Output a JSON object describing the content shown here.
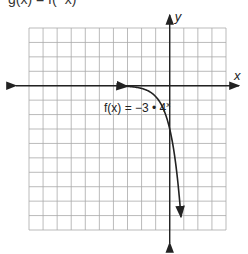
{
  "header_fragment": "g(x) = f(−x)",
  "chart_data": {
    "type": "line",
    "title": "",
    "xlabel": "x",
    "ylabel": "y",
    "xlim": [
      -10,
      4
    ],
    "ylim": [
      -10,
      4
    ],
    "grid": true,
    "grid_step": 1,
    "series": [
      {
        "name": "f(x) = −3 • 4^x",
        "function": "-3*4^x",
        "x_start": -3,
        "x_end": 0.8,
        "arrow_ends": [
          "left",
          "down"
        ]
      }
    ],
    "annotation": {
      "text_main": "f(x) = −3 • 4",
      "text_sup": "x"
    }
  }
}
